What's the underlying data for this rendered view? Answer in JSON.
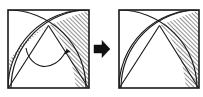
{
  "figure": {
    "title": "Curvilinear triangle area equivalence",
    "type": "geometric-diagram",
    "background_color": "#ffffff",
    "stroke_color": "#1a1a1a",
    "hatch_color": "#2b2b2b",
    "arrow_color": "#111111",
    "panel_count": 2
  },
  "panels": [
    {
      "id": "before",
      "label": "before",
      "square": {
        "x": 8,
        "y": 10,
        "width": 81,
        "height": 78
      },
      "apex": {
        "x": 48.5,
        "y": 25.5
      },
      "shaded_regions": [
        {
          "name": "left-crescent",
          "hatched": true,
          "hatch_angle_deg": 45
        },
        {
          "name": "right-curvilinear-region",
          "hatched": true,
          "hatch_angle_deg": 45
        }
      ],
      "annotations": [
        {
          "name": "transfer-arrow",
          "kind": "curved-arrow",
          "from": "left-crescent",
          "to": "right-curvilinear-region"
        }
      ],
      "arcs": [
        {
          "name": "arc-from-bottom-left",
          "center_corner": "bottom-left"
        },
        {
          "name": "arc-from-bottom-right",
          "center_corner": "bottom-right"
        },
        {
          "name": "arc-from-top-left",
          "center_corner": "top-left"
        }
      ],
      "chords": [
        {
          "name": "chord-apex-to-bottom-left"
        },
        {
          "name": "chord-apex-to-bottom-right"
        }
      ]
    },
    {
      "id": "after",
      "label": "after",
      "square": {
        "x": 119,
        "y": 10,
        "width": 80,
        "height": 78
      },
      "apex": {
        "x": 159.5,
        "y": 25.5
      },
      "shaded_regions": [
        {
          "name": "combined-curvilinear-region",
          "hatched": true,
          "hatch_angle_deg": 45
        }
      ],
      "annotations": [],
      "arcs": [
        {
          "name": "arc-from-bottom-left",
          "center_corner": "bottom-left"
        },
        {
          "name": "arc-from-bottom-right",
          "center_corner": "bottom-right"
        },
        {
          "name": "arc-from-top-left",
          "center_corner": "top-left"
        }
      ],
      "chords": [
        {
          "name": "chord-apex-to-bottom-left"
        },
        {
          "name": "chord-apex-to-bottom-right"
        }
      ]
    }
  ],
  "transition": {
    "name": "implies-arrow",
    "glyph": "➡",
    "direction": "right",
    "x": 94,
    "y": 40,
    "size": 16
  }
}
